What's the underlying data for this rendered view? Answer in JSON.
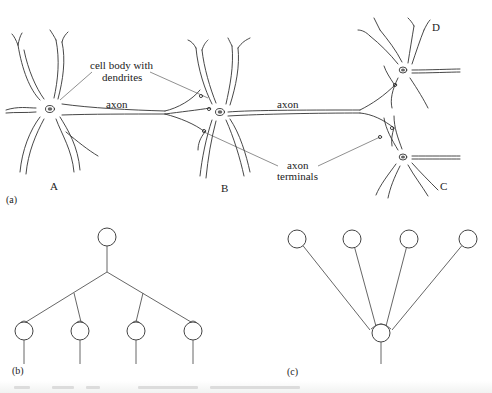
{
  "figure": {
    "panels": [
      {
        "id": "a",
        "label": "(a)",
        "x": 6,
        "y": 203
      },
      {
        "id": "b",
        "label": "(b)",
        "x": 12,
        "y": 374
      },
      {
        "id": "c",
        "label": "(c)",
        "x": 287,
        "y": 375
      }
    ],
    "neurons": [
      {
        "id": "A",
        "label": "A",
        "cx": 50,
        "cy": 109,
        "label_x": 50,
        "label_y": 190
      },
      {
        "id": "B",
        "label": "B",
        "cx": 220,
        "cy": 112,
        "label_x": 221,
        "label_y": 192
      },
      {
        "id": "D",
        "label": "D",
        "cx": 403,
        "cy": 70,
        "label_x": 432,
        "label_y": 31
      },
      {
        "id": "C",
        "label": "C",
        "cx": 403,
        "cy": 157,
        "label_x": 440,
        "label_y": 190
      }
    ],
    "annotations": {
      "cell_body_line1": "cell body with",
      "cell_body_line2": "dendrites",
      "axon_1": "axon",
      "axon_2": "axon",
      "axon_terminals_line1": "axon",
      "axon_terminals_line2": "terminals"
    },
    "tree_b": {
      "root": {
        "cx": 107,
        "cy": 237,
        "r": 9
      },
      "junction": {
        "x": 107,
        "y": 272
      },
      "branch_points": [
        {
          "x": 74,
          "y": 293
        },
        {
          "x": 143,
          "y": 293
        }
      ],
      "leaves": [
        {
          "cx": 24,
          "cy": 331,
          "r": 9
        },
        {
          "cx": 80,
          "cy": 331,
          "r": 9
        },
        {
          "cx": 136,
          "cy": 331,
          "r": 9
        },
        {
          "cx": 193,
          "cy": 331,
          "r": 9
        }
      ],
      "stem_bottom": 364
    },
    "tree_c": {
      "inputs": [
        {
          "cx": 297,
          "cy": 239,
          "r": 9
        },
        {
          "cx": 352,
          "cy": 239,
          "r": 9
        },
        {
          "cx": 409,
          "cy": 239,
          "r": 9
        },
        {
          "cx": 468,
          "cy": 239,
          "r": 9
        }
      ],
      "output": {
        "cx": 381,
        "cy": 333,
        "r": 9
      },
      "stem_bottom": 364
    },
    "caption": {
      "visible_text": ""
    }
  }
}
